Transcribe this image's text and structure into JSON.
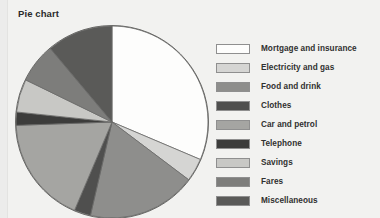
{
  "chart_title": "Pie chart",
  "background_color": "#f2f2f0",
  "chart_data": {
    "type": "pie",
    "title": "Pie chart",
    "xlabel": "",
    "ylabel": "",
    "legend_position": "right",
    "start_angle_deg": 0,
    "direction": "clockwise",
    "categories": [
      "Mortgage and insurance",
      "Electricity and gas",
      "Food and drink",
      "Clothes",
      "Car and petrol",
      "Telephone",
      "Savings",
      "Fares",
      "Miscellaneous"
    ],
    "values": [
      31.4,
      3.9,
      18.3,
      2.8,
      18.1,
      2.2,
      5.6,
      6.7,
      11.0
    ],
    "unit": "percent",
    "colors": [
      "#fdfdfc",
      "#d5d5d3",
      "#8e8e8c",
      "#4f4f4e",
      "#a5a5a2",
      "#3c3c3b",
      "#c8c8c5",
      "#7d7d7b",
      "#5a5a58"
    ],
    "slice_border_color": "#6a6a68",
    "slices": [
      {
        "label": "Mortgage and insurance",
        "value": 31.4,
        "start_deg": 0,
        "end_deg": 113,
        "color": "#fdfdfc"
      },
      {
        "label": "Electricity and gas",
        "value": 3.9,
        "start_deg": 113,
        "end_deg": 127,
        "color": "#d5d5d3"
      },
      {
        "label": "Food and drink",
        "value": 18.3,
        "start_deg": 127,
        "end_deg": 193,
        "color": "#8e8e8c"
      },
      {
        "label": "Clothes",
        "value": 2.8,
        "start_deg": 193,
        "end_deg": 203,
        "color": "#4f4f4e"
      },
      {
        "label": "Car and petrol",
        "value": 18.1,
        "start_deg": 203,
        "end_deg": 268,
        "color": "#a5a5a2"
      },
      {
        "label": "Telephone",
        "value": 2.2,
        "start_deg": 268,
        "end_deg": 276,
        "color": "#3c3c3b"
      },
      {
        "label": "Savings",
        "value": 5.6,
        "start_deg": 276,
        "end_deg": 296,
        "color": "#c8c8c5"
      },
      {
        "label": "Fares",
        "value": 6.7,
        "start_deg": 296,
        "end_deg": 320,
        "color": "#7d7d7b"
      },
      {
        "label": "Miscellaneous",
        "value": 11.0,
        "start_deg": 320,
        "end_deg": 360,
        "color": "#5a5a58"
      }
    ]
  },
  "legend": {
    "items": [
      {
        "label": "Mortgage and insurance",
        "color": "#fdfdfc"
      },
      {
        "label": "Electricity and gas",
        "color": "#d5d5d3"
      },
      {
        "label": "Food and drink",
        "color": "#8e8e8c"
      },
      {
        "label": "Clothes",
        "color": "#4f4f4e"
      },
      {
        "label": "Car and petrol",
        "color": "#a5a5a2"
      },
      {
        "label": "Telephone",
        "color": "#3c3c3b"
      },
      {
        "label": "Savings",
        "color": "#c8c8c5"
      },
      {
        "label": "Fares",
        "color": "#7d7d7b"
      },
      {
        "label": "Miscellaneous",
        "color": "#5a5a58"
      }
    ]
  }
}
